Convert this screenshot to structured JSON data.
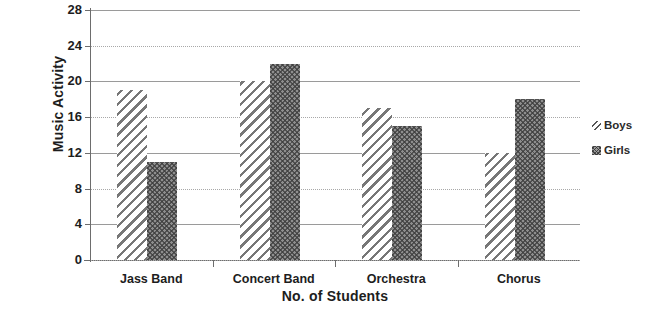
{
  "chart_data": {
    "type": "bar",
    "title": "",
    "xlabel": "No. of Students",
    "ylabel": "Music Activity",
    "categories": [
      "Jass Band",
      "Concert Band",
      "Orchestra",
      "Chorus"
    ],
    "series": [
      {
        "name": "Boys",
        "pattern": "diagonal-hatch",
        "values": [
          19,
          20,
          17,
          12
        ]
      },
      {
        "name": "Girls",
        "pattern": "cross-hatch",
        "values": [
          11,
          22,
          15,
          18
        ]
      }
    ],
    "ylim": [
      0,
      28
    ],
    "y_ticks": [
      0,
      4,
      8,
      12,
      16,
      20,
      24,
      28
    ],
    "grid": true,
    "legend_position": "right",
    "colors": {
      "boys": "#777777",
      "girls": "#8e8e8e",
      "axis": "#6d6d6d",
      "gridline": "#9a9a9a",
      "text": "#1d1d1d",
      "background": "#ffffff"
    }
  }
}
